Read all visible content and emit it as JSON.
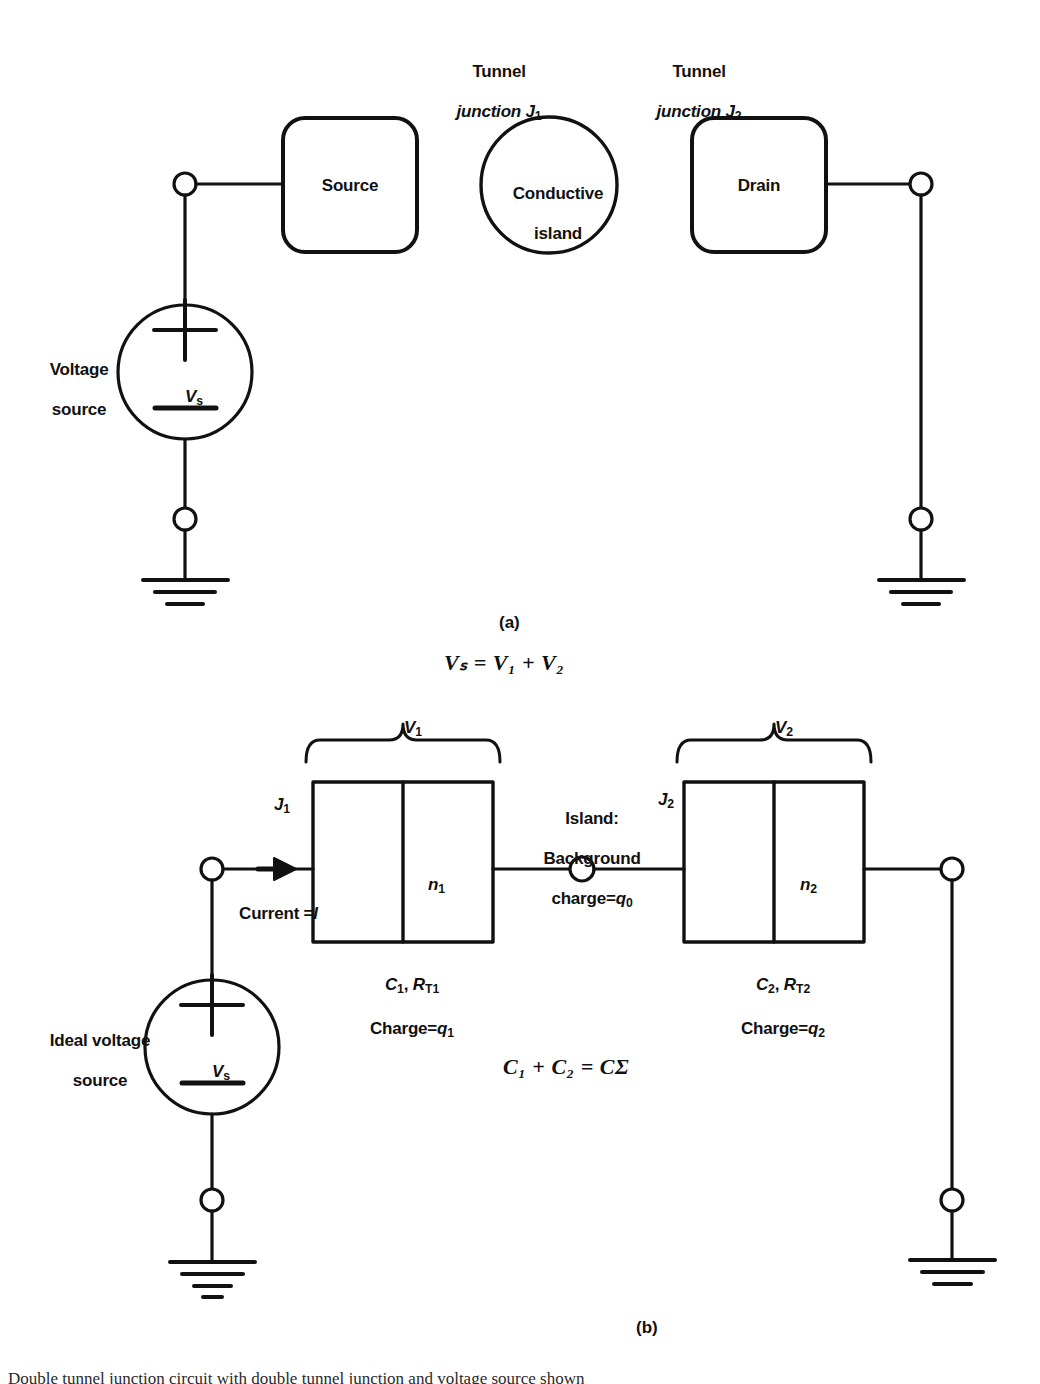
{
  "figure": {
    "panel_a": {
      "caption": "(a)",
      "labels": {
        "tunnel_junction_1_line1": "Tunnel",
        "tunnel_junction_1_line2": "junction J",
        "tunnel_junction_1_sub": "1",
        "tunnel_junction_2_line1": "Tunnel",
        "tunnel_junction_2_line2": "junction J",
        "tunnel_junction_2_sub": "2",
        "source_box": "Source",
        "island_line1": "Conductive",
        "island_line2": "island",
        "drain_box": "Drain",
        "voltage_source_line1": "Voltage",
        "voltage_source_line2": "source",
        "vs_symbol": "V",
        "vs_sub": "s"
      }
    },
    "equation_vs": "Vₛ = V₁ + V₂",
    "panel_b": {
      "caption": "(b)",
      "labels": {
        "v1": "V",
        "v1_sub": "1",
        "v2": "V",
        "v2_sub": "2",
        "j1": "J",
        "j1_sub": "1",
        "j2": "J",
        "j2_sub": "2",
        "n1": "n",
        "n1_sub": "1",
        "n2": "n",
        "n2_sub": "2",
        "current": "Current =",
        "current_symbol": "I",
        "island_line1": "Island:",
        "island_line2": "Background",
        "island_line3_prefix": "charge=",
        "island_line3_symbol": "q",
        "island_line3_sub": "0",
        "junction1_params_c": "C",
        "junction1_params_c_sub": "1",
        "junction1_params_sep": ", ",
        "junction1_params_r": "R",
        "junction1_params_r_sub": "T1",
        "junction1_charge_prefix": "Charge=",
        "junction1_charge_symbol": "q",
        "junction1_charge_sub": "1",
        "junction2_params_c": "C",
        "junction2_params_c_sub": "2",
        "junction2_params_r": "R",
        "junction2_params_r_sub": "T2",
        "junction2_charge_prefix": "Charge=",
        "junction2_charge_symbol": "q",
        "junction2_charge_sub": "2",
        "ideal_voltage_source_line1": "Ideal voltage",
        "ideal_voltage_source_line2": "source",
        "vs_symbol": "V",
        "vs_sub": "s"
      },
      "equation_c": "C₁ + C₂ = CΣ"
    },
    "colors": {
      "ink": "#111111",
      "background": "#ffffff"
    }
  },
  "page": {
    "bottom_text": "Double tunnel junction circuit with double tunnel junction and voltage source shown"
  }
}
